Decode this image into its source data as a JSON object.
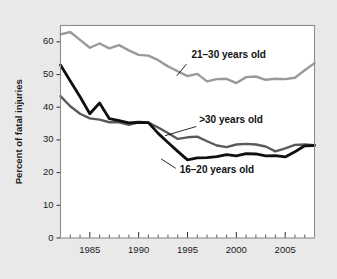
{
  "figure": {
    "background_color": "#e9e9e9",
    "plot_background_color": "#ffffff",
    "frame_color": "#8d8d8d"
  },
  "chart_data": {
    "type": "line",
    "title": "",
    "xlabel": "",
    "ylabel": "Percent of fatal injuries",
    "xlim": [
      1982,
      2008
    ],
    "ylim": [
      0,
      65
    ],
    "yticks": [
      0,
      10,
      20,
      30,
      40,
      50,
      60
    ],
    "ytick_labels": [
      "0",
      "10",
      "20",
      "30",
      "40",
      "50",
      "60"
    ],
    "xticks": [
      1985,
      1990,
      1995,
      2000,
      2005
    ],
    "xtick_labels": [
      "1985",
      "1990",
      "1995",
      "2000",
      "2005"
    ],
    "x_minor_tick_interval": 1,
    "grid": false,
    "legend_position": "inline-annotations",
    "x": [
      1982,
      1983,
      1984,
      1985,
      1986,
      1987,
      1988,
      1989,
      1990,
      1991,
      1992,
      1993,
      1994,
      1995,
      1996,
      1997,
      1998,
      1999,
      2000,
      2001,
      2002,
      2003,
      2004,
      2005,
      2006,
      2007,
      2008
    ],
    "series": [
      {
        "name": "21-30 years old",
        "label": "21–30 years old",
        "color": "#9a9a9a",
        "width": 2.4,
        "values": [
          62.3,
          63.0,
          60.6,
          58.2,
          59.5,
          58.0,
          59.0,
          57.4,
          56.0,
          55.8,
          54.4,
          52.5,
          51.0,
          49.5,
          50.2,
          47.9,
          48.6,
          48.7,
          47.4,
          49.2,
          49.4,
          48.4,
          48.7,
          48.6,
          49.0,
          51.3,
          53.5
        ]
      },
      {
        "name": ">30 years old",
        "label": ">30 years old",
        "color": "#5a5a5a",
        "width": 2.4,
        "values": [
          43.4,
          40.3,
          38.0,
          36.6,
          36.2,
          35.4,
          35.4,
          34.6,
          35.4,
          35.3,
          33.8,
          32.1,
          30.3,
          30.8,
          31.0,
          29.6,
          28.3,
          27.8,
          28.6,
          28.8,
          28.6,
          28.0,
          26.5,
          27.4,
          28.5,
          28.6,
          28.4
        ]
      },
      {
        "name": "16-20 years old",
        "label": "16–20 years old",
        "color": "#101010",
        "width": 2.8,
        "values": [
          52.9,
          48.0,
          43.2,
          38.0,
          41.3,
          36.5,
          35.9,
          35.2,
          35.4,
          35.3,
          32.0,
          29.2,
          26.5,
          23.9,
          24.5,
          24.6,
          24.9,
          25.5,
          25.1,
          25.8,
          25.7,
          25.1,
          25.2,
          24.8,
          26.4,
          28.2,
          28.3
        ]
      }
    ],
    "annotations": [
      {
        "text": "21–30 years old",
        "for_series": "21-30 years old",
        "text_x": 1995.4,
        "text_y": 55.0,
        "leader_from_x": 1994.9,
        "leader_from_y": 53.2,
        "leader_to_x": 1993.9,
        "leader_to_y": 49.6
      },
      {
        "text": ">30 years old",
        "for_series": ">30 years old",
        "text_x": 1996.2,
        "text_y": 35.2,
        "leader_from_x": 1995.9,
        "leader_from_y": 34.1,
        "leader_to_x": 1992.7,
        "leader_to_y": 31.3
      },
      {
        "text": "16–20 years old",
        "for_series": "16-20 years old",
        "text_x": 1994.2,
        "text_y": 20.0,
        "leader_from_x": 1993.8,
        "leader_from_y": 21.3,
        "leader_to_x": 1992.3,
        "leader_to_y": 24.2
      }
    ]
  }
}
